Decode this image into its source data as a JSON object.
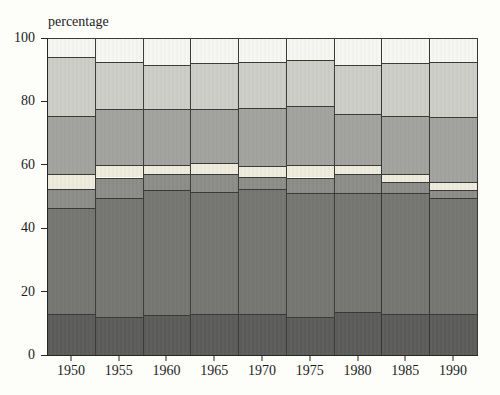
{
  "title": "percentage",
  "chart_data": {
    "type": "bar",
    "stacked": true,
    "title": "percentage",
    "xlabel": "",
    "ylabel": "percentage",
    "ylim": [
      0,
      100
    ],
    "yticks": [
      0,
      20,
      40,
      60,
      80,
      100
    ],
    "grid": false,
    "legend": "none",
    "categories": [
      "1950",
      "1955",
      "1960",
      "1965",
      "1970",
      "1975",
      "1980",
      "1985",
      "1990"
    ],
    "series": [
      {
        "name": "dark-gray-bottom",
        "color": "#5d5d5b",
        "values": [
          13,
          12,
          12.5,
          13,
          13,
          12,
          13.5,
          13,
          13
        ]
      },
      {
        "name": "medium-dark-gray",
        "color": "#767672",
        "values": [
          33.5,
          37.5,
          39.5,
          38.5,
          39.5,
          39,
          37.5,
          38,
          36.5
        ]
      },
      {
        "name": "gray-band",
        "color": "#8d8d89",
        "values": [
          6,
          6.5,
          5,
          5.5,
          3.5,
          5,
          6,
          3.5,
          2.5
        ]
      },
      {
        "name": "cream-band",
        "color": "#eeecdc",
        "values": [
          4.5,
          4,
          3,
          3.5,
          3.5,
          4,
          3,
          2.5,
          2.5
        ]
      },
      {
        "name": "medium-gray",
        "color": "#a3a39f",
        "values": [
          18.5,
          17.5,
          17.5,
          17,
          18.5,
          18.5,
          16,
          18.5,
          20.5
        ]
      },
      {
        "name": "light-gray",
        "color": "#cecec8",
        "values": [
          18.5,
          15,
          14,
          14.5,
          14.5,
          14.5,
          15.5,
          16.5,
          17.5
        ]
      },
      {
        "name": "near-white-top",
        "color": "#f6f6f2",
        "values": [
          6,
          7.5,
          8.5,
          8,
          7.5,
          7,
          8.5,
          8,
          7.5
        ]
      }
    ]
  },
  "colors": {
    "axis": "#262624",
    "segment_outline": "#393937",
    "background": "#fdfdfa",
    "text": "#1c1c1c"
  }
}
